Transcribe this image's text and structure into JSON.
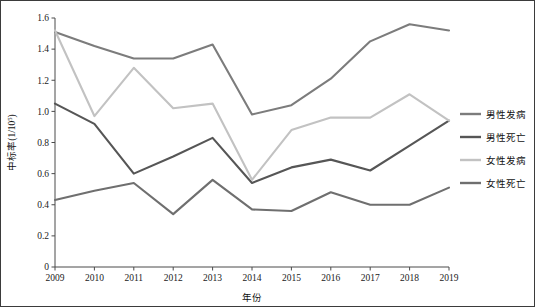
{
  "chart_data": {
    "type": "line",
    "title": "",
    "subtitle": "",
    "xlabel": "年份",
    "ylabel": "中标率(1/10⁵)",
    "ylabel_base": "中标率(1/10",
    "ylabel_exp": "5",
    "ylabel_tail": ")",
    "x": [
      2009,
      2010,
      2011,
      2012,
      2013,
      2014,
      2015,
      2016,
      2017,
      2018,
      2019
    ],
    "categories": [
      "2009",
      "2010",
      "2011",
      "2012",
      "2013",
      "2014",
      "2015",
      "2016",
      "2017",
      "2018",
      "2019"
    ],
    "xlim": [
      2009,
      2019
    ],
    "ylim": [
      0,
      1.6
    ],
    "yticks": [
      "0",
      "0.2",
      "0.4",
      "0.6",
      "0.8",
      "1.0",
      "1.2",
      "1.4",
      "1.6"
    ],
    "ytick_values": [
      0,
      0.2,
      0.4,
      0.6,
      0.8,
      1.0,
      1.2,
      1.4,
      1.6
    ],
    "grid": false,
    "legend_position": "right",
    "series": [
      {
        "name": "男性发病",
        "color": "#7c7c7c",
        "values": [
          1.51,
          1.42,
          1.34,
          1.34,
          1.43,
          0.98,
          1.04,
          1.21,
          1.45,
          1.56,
          1.52
        ]
      },
      {
        "name": "男性死亡",
        "color": "#565656",
        "values": [
          1.05,
          0.92,
          0.6,
          0.71,
          0.83,
          0.54,
          0.64,
          0.69,
          0.62,
          0.78,
          0.94
        ]
      },
      {
        "name": "女性发病",
        "color": "#c2c2c2",
        "values": [
          1.52,
          0.97,
          1.28,
          1.02,
          1.05,
          0.56,
          0.88,
          0.96,
          0.96,
          1.11,
          0.94
        ]
      },
      {
        "name": "女性死亡",
        "color": "#6f6f6f",
        "values": [
          0.43,
          0.49,
          0.54,
          0.34,
          0.56,
          0.37,
          0.36,
          0.48,
          0.4,
          0.4,
          0.51
        ]
      }
    ]
  },
  "colors": {
    "axis": "#4a4a4a",
    "text": "#111111",
    "border": "#3b3b3b",
    "background": "#ffffff"
  }
}
